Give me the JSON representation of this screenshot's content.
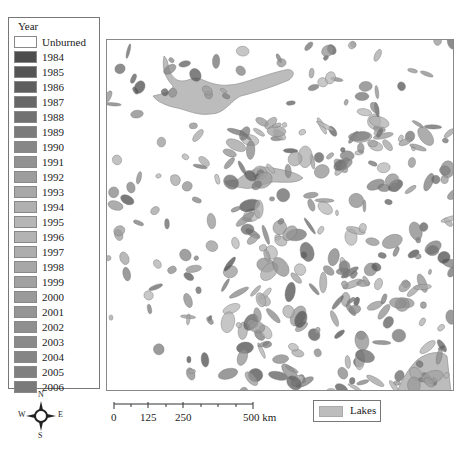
{
  "legend": {
    "title": "Year",
    "items": [
      {
        "label": "Unburned",
        "color": "#ffffff"
      },
      {
        "label": "1984",
        "color": "#4d4d4d"
      },
      {
        "label": "1985",
        "color": "#555555"
      },
      {
        "label": "1986",
        "color": "#5e5e5e"
      },
      {
        "label": "1987",
        "color": "#676767"
      },
      {
        "label": "1988",
        "color": "#717171"
      },
      {
        "label": "1989",
        "color": "#7b7b7b"
      },
      {
        "label": "1990",
        "color": "#878787"
      },
      {
        "label": "1991",
        "color": "#929292"
      },
      {
        "label": "1992",
        "color": "#9d9d9d"
      },
      {
        "label": "1993",
        "color": "#a8a8a8"
      },
      {
        "label": "1994",
        "color": "#b0b0b0"
      },
      {
        "label": "1995",
        "color": "#b6b6b6"
      },
      {
        "label": "1996",
        "color": "#b3b3b3"
      },
      {
        "label": "1997",
        "color": "#adadad"
      },
      {
        "label": "1998",
        "color": "#a7a7a7"
      },
      {
        "label": "1999",
        "color": "#a1a1a1"
      },
      {
        "label": "2000",
        "color": "#9a9a9a"
      },
      {
        "label": "2001",
        "color": "#959595"
      },
      {
        "label": "2002",
        "color": "#8f8f8f"
      },
      {
        "label": "2003",
        "color": "#8a8a8a"
      },
      {
        "label": "2004",
        "color": "#858585"
      },
      {
        "label": "2005",
        "color": "#808080"
      },
      {
        "label": "2006",
        "color": "#7a7a7a"
      }
    ]
  },
  "compass": {
    "n": "N",
    "s": "S",
    "e": "E",
    "w": "W"
  },
  "scale_bar": {
    "ticks": [
      "0",
      "125",
      "250",
      "500 km"
    ]
  },
  "lakes_legend": {
    "label": "Lakes",
    "color": "#bdbdbd"
  }
}
